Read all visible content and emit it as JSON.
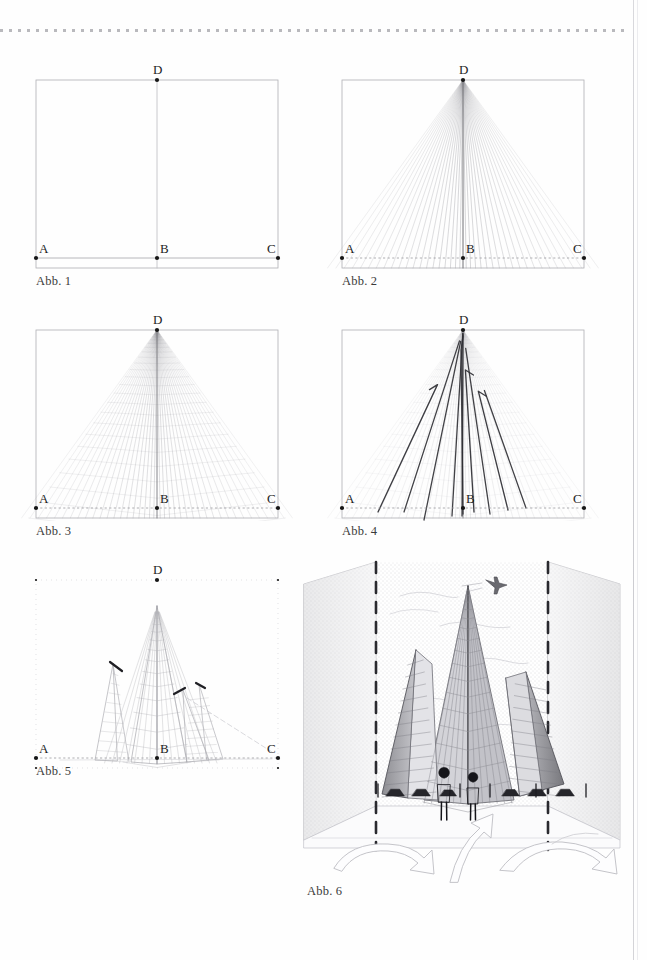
{
  "page": {
    "background": "#fefefe",
    "ink": "#2b2b2b",
    "rule_color": "#b9b9bd",
    "edge_color": "#d2d2d6"
  },
  "figures": [
    {
      "id": "fig1",
      "caption": "Abb. 1",
      "description": "Leeres Bildfeld mit Grundlinie und Mittelachse",
      "points": [
        {
          "name": "A",
          "label": "A",
          "x": 0,
          "y": 178
        },
        {
          "name": "B",
          "label": "B",
          "x": 121,
          "y": 178
        },
        {
          "name": "C",
          "label": "C",
          "x": 242,
          "y": 178
        },
        {
          "name": "D",
          "label": "D",
          "x": 121,
          "y": 0
        }
      ],
      "frame": {
        "width": 242,
        "height": 188
      },
      "elements": [
        "frame-rectangle",
        "vertical-axis-B-to-D",
        "baseline-A-to-C"
      ]
    },
    {
      "id": "fig2",
      "caption": "Abb. 2",
      "description": "Strahlenbuendel vom Fluchtpunkt D zu Punkten der Grundlinie",
      "points": [
        {
          "name": "A",
          "label": "A",
          "x": 0,
          "y": 178
        },
        {
          "name": "B",
          "label": "B",
          "x": 121,
          "y": 178
        },
        {
          "name": "C",
          "label": "C",
          "x": 242,
          "y": 178
        },
        {
          "name": "D",
          "label": "D",
          "x": 121,
          "y": 0
        }
      ],
      "frame": {
        "width": 242,
        "height": 188
      },
      "ray_count": 41,
      "elements": [
        "frame-rectangle",
        "ray-fan-from-D",
        "dotted-baseline"
      ]
    },
    {
      "id": "fig3",
      "caption": "Abb. 3",
      "description": "Strahlenbuendel mit eingezeichneten Querlinien ergibt Raster",
      "points": [
        {
          "name": "A",
          "label": "A",
          "x": 0,
          "y": 178
        },
        {
          "name": "B",
          "label": "B",
          "x": 121,
          "y": 178
        },
        {
          "name": "C",
          "label": "C",
          "x": 242,
          "y": 178
        },
        {
          "name": "D",
          "label": "D",
          "x": 121,
          "y": 0
        }
      ],
      "frame": {
        "width": 242,
        "height": 188
      },
      "ray_count": 41,
      "cross_line_count": 26,
      "elements": [
        "frame-rectangle",
        "ray-fan-from-D",
        "v-shaped-cross-lines",
        "dotted-baseline"
      ]
    },
    {
      "id": "fig4",
      "caption": "Abb. 4",
      "description": "Gebaeudekanten werden im Raster kraeftig nachgezogen",
      "points": [
        {
          "name": "A",
          "label": "A",
          "x": 0,
          "y": 178
        },
        {
          "name": "B",
          "label": "B",
          "x": 121,
          "y": 178
        },
        {
          "name": "C",
          "label": "C",
          "x": 242,
          "y": 178
        },
        {
          "name": "D",
          "label": "D",
          "x": 121,
          "y": 0
        }
      ],
      "frame": {
        "width": 242,
        "height": 188
      },
      "ray_count": 41,
      "cross_line_count": 26,
      "bold_edge_count": 9,
      "elements": [
        "frame-rectangle",
        "faint-ray-grid",
        "bold-building-edges",
        "dotted-baseline"
      ]
    },
    {
      "id": "fig5",
      "caption": "Abb. 5",
      "description": "Bereinigte Zeichnung des Hochhauses mit Fassadenraster",
      "points": [
        {
          "name": "A",
          "label": "A",
          "x": 0,
          "y": 178
        },
        {
          "name": "B",
          "label": "B",
          "x": 121,
          "y": 178
        },
        {
          "name": "C",
          "label": "C",
          "x": 242,
          "y": 178
        },
        {
          "name": "D",
          "label": "D",
          "x": 121,
          "y": 0
        }
      ],
      "frame": {
        "width": 242,
        "height": 188
      },
      "peak_marks": 3,
      "elements": [
        "frame-corner-ticks",
        "tower-facets",
        "facade-grid",
        "peak-accent-marks",
        "dotted-baseline"
      ]
    },
    {
      "id": "fig6",
      "caption": "Abb. 6",
      "description": "Fertige perspektivische Darstellung des Hochhauses mit Umgebung",
      "elements": [
        "sky-hatching",
        "side-walls",
        "dashed-vertical-guides",
        "tower-body",
        "facade-grid",
        "two-pedestrians",
        "car-row",
        "street-lamps",
        "airplane",
        "plaza-floor",
        "curved-arrows"
      ],
      "figure_count": 2,
      "car_count": 6,
      "arrow_count": 3
    }
  ],
  "decor": {
    "top_rule": {
      "dot_count": 70,
      "dot_spacing": 9,
      "dot_size": 3
    },
    "page_edge_label": "page-edge-line"
  }
}
